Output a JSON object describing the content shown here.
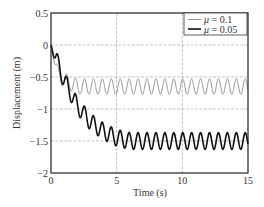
{
  "chart_data": {
    "type": "line",
    "title": "",
    "xlabel": "Time (s)",
    "ylabel": "Displacement (m)",
    "xlim": [
      0,
      15
    ],
    "ylim": [
      -2,
      0.5
    ],
    "xticks": [
      0,
      5,
      10,
      15
    ],
    "xtick_labels": [
      "0",
      "5",
      "10",
      "15"
    ],
    "yticks": [
      0.5,
      0,
      -0.5,
      -1,
      -1.5,
      -2
    ],
    "ytick_labels": [
      "0.5",
      "0",
      "-0.5",
      "-1",
      "-1.5",
      "-2"
    ],
    "grid": true,
    "legend_position": "upper right",
    "series": [
      {
        "name": "μ = 0.1",
        "mu_symbol": "μ",
        "mu_value": "= 0.1",
        "color": "#888888",
        "line_width": 0.9,
        "x": [
          0,
          0.5,
          1.0,
          1.5,
          2.0,
          3.0,
          5.0,
          7.5,
          10.0,
          12.5,
          15.0
        ],
        "values": [
          0,
          -0.45,
          -0.55,
          -0.6,
          -0.65,
          -0.65,
          -0.65,
          -0.65,
          -0.65,
          -0.65,
          -0.65
        ],
        "steady_state_mean": -0.65,
        "oscillation_amplitude": 0.12,
        "oscillation_period_s": 0.68,
        "settle_time_s": 1.0
      },
      {
        "name": "μ = 0.05",
        "mu_symbol": "μ",
        "mu_value": "= 0.05",
        "color": "#111111",
        "line_width": 1.6,
        "x": [
          0,
          1.0,
          2.0,
          3.0,
          4.0,
          5.0,
          6.0,
          7.5,
          10.0,
          12.5,
          15.0
        ],
        "values": [
          0,
          -0.55,
          -0.95,
          -1.2,
          -1.35,
          -1.45,
          -1.5,
          -1.5,
          -1.5,
          -1.5,
          -1.5
        ],
        "steady_state_mean": -1.5,
        "oscillation_amplitude": 0.13,
        "oscillation_period_s": 0.68,
        "settle_time_s": 6.0
      }
    ]
  }
}
